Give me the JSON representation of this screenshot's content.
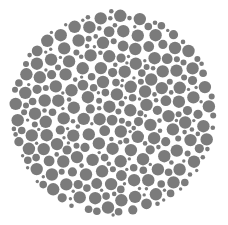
{
  "image": {
    "subject": "dot-pattern color vision test plate (grayscale)",
    "background_color": "#ffffff",
    "dot_color": "#7b7b7b",
    "hidden_figure_visible": false
  }
}
